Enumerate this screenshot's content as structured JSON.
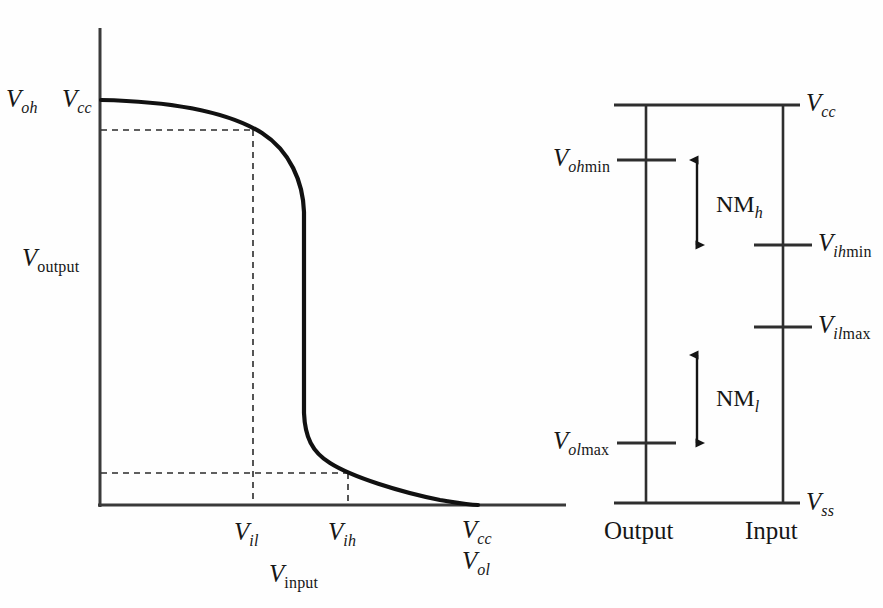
{
  "figure": {
    "background_color": "#fefefe",
    "line_color": "#1a1a1a",
    "curve_color": "#111111"
  },
  "left_plot": {
    "name": "voltage-transfer-characteristic",
    "y_axis_label": {
      "var": "V",
      "sub": "output"
    },
    "x_axis_label": {
      "var": "V",
      "sub": "input"
    },
    "top_left_labels": [
      {
        "var": "V",
        "sub": "oh"
      },
      {
        "var": "V",
        "sub": "cc"
      }
    ],
    "x_tick_labels": [
      {
        "var": "V",
        "sub": "il"
      },
      {
        "var": "V",
        "sub": "ih"
      }
    ],
    "x_end_labels": [
      {
        "var": "V",
        "sub": "cc"
      },
      {
        "var": "V",
        "sub": "ol"
      }
    ],
    "guides": {
      "dashed_horizontal_upper": true,
      "dashed_horizontal_lower": true,
      "dashed_vertical_il": true,
      "dashed_vertical_ih": true
    }
  },
  "right_plot": {
    "name": "noise-margin-diagram",
    "column_labels": [
      "Output",
      "Input"
    ],
    "top_label": {
      "var": "V",
      "sub": "cc"
    },
    "bottom_label": {
      "var": "V",
      "sub": "ss"
    },
    "output_levels": [
      {
        "var": "V",
        "sub_i": "oh",
        "sub_u": "min"
      },
      {
        "var": "V",
        "sub_i": "ol",
        "sub_u": "max"
      }
    ],
    "input_levels": [
      {
        "var": "V",
        "sub_i": "ih",
        "sub_u": "min"
      },
      {
        "var": "V",
        "sub_i": "il",
        "sub_u": "max"
      }
    ],
    "noise_margins": [
      {
        "label": "NM",
        "sub": "h"
      },
      {
        "label": "NM",
        "sub": "l"
      }
    ]
  }
}
